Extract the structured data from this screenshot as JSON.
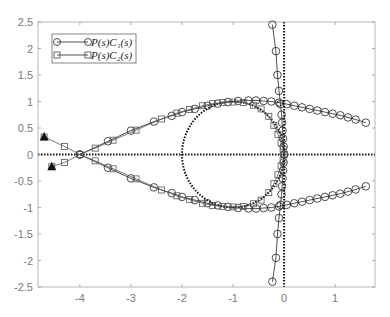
{
  "chart_data": {
    "type": "line",
    "title": "",
    "xlabel": "",
    "ylabel": "",
    "xlim": [
      -4.82,
      1.78
    ],
    "ylim": [
      -2.5,
      2.5
    ],
    "grid": false,
    "legend_position": "top-left",
    "x_ticks": [
      {
        "value": -4,
        "label": "-4"
      },
      {
        "value": -3,
        "label": "-3"
      },
      {
        "value": -2,
        "label": "-2"
      },
      {
        "value": -1,
        "label": "-1"
      },
      {
        "value": 0,
        "label": "0"
      },
      {
        "value": 1,
        "label": "1"
      }
    ],
    "y_ticks": [
      {
        "value": 2.5,
        "label": "2.5"
      },
      {
        "value": 2,
        "label": "2"
      },
      {
        "value": 1.5,
        "label": "1.5"
      },
      {
        "value": 1,
        "label": "1"
      },
      {
        "value": 0.5,
        "label": "0.5"
      },
      {
        "value": 0,
        "label": "0"
      },
      {
        "value": -0.5,
        "label": "-0.5"
      },
      {
        "value": -1,
        "label": "-1"
      },
      {
        "value": -1.5,
        "label": "-1.5"
      },
      {
        "value": -2,
        "label": "-2"
      },
      {
        "value": -2.5,
        "label": "-2.5"
      }
    ],
    "legend": [
      {
        "label": "P(s)C₁(s)",
        "marker": "circle"
      },
      {
        "label": "P(s)C₂(s)",
        "marker": "square"
      }
    ],
    "reference": {
      "unit_circle": {
        "center": [
          -1,
          0
        ],
        "radius": 1,
        "style": "dotted"
      },
      "horizontal_axis_line": {
        "y": 0,
        "style": "dotted"
      },
      "vertical_axis_line": {
        "x": 0,
        "style": "dotted"
      }
    },
    "annotations": [
      {
        "type": "triangle-marker",
        "x": -4.7,
        "y": 0.33
      },
      {
        "type": "triangle-marker",
        "x": -4.55,
        "y": -0.23
      }
    ],
    "series": [
      {
        "name": "P(s)C1(s) upper branch",
        "marker": "circle",
        "points": [
          [
            -4.0,
            0.0
          ],
          [
            -3.45,
            0.25
          ],
          [
            -3.0,
            0.45
          ],
          [
            -2.55,
            0.62
          ],
          [
            -2.2,
            0.73
          ],
          [
            -2.0,
            0.8
          ],
          [
            -1.75,
            0.86
          ],
          [
            -1.5,
            0.92
          ],
          [
            -1.3,
            0.96
          ],
          [
            -1.1,
            0.99
          ],
          [
            -0.9,
            1.01
          ],
          [
            -0.7,
            1.02
          ],
          [
            -0.55,
            1.02
          ],
          [
            -0.4,
            1.01
          ],
          [
            -0.25,
            1.0
          ],
          [
            -0.1,
            0.98
          ],
          [
            0.05,
            0.95
          ],
          [
            0.2,
            0.92
          ],
          [
            0.35,
            0.89
          ],
          [
            0.5,
            0.86
          ],
          [
            0.65,
            0.83
          ],
          [
            0.8,
            0.8
          ],
          [
            0.95,
            0.77
          ],
          [
            1.1,
            0.74
          ],
          [
            1.25,
            0.7
          ],
          [
            1.4,
            0.66
          ],
          [
            1.6,
            0.6
          ]
        ]
      },
      {
        "name": "P(s)C1(s) lower branch",
        "marker": "circle",
        "points": [
          [
            -4.0,
            0.0
          ],
          [
            -3.45,
            -0.25
          ],
          [
            -3.0,
            -0.45
          ],
          [
            -2.55,
            -0.62
          ],
          [
            -2.2,
            -0.73
          ],
          [
            -2.0,
            -0.8
          ],
          [
            -1.75,
            -0.86
          ],
          [
            -1.5,
            -0.92
          ],
          [
            -1.3,
            -0.96
          ],
          [
            -1.1,
            -0.99
          ],
          [
            -0.9,
            -1.01
          ],
          [
            -0.7,
            -1.02
          ],
          [
            -0.55,
            -1.02
          ],
          [
            -0.4,
            -1.01
          ],
          [
            -0.25,
            -1.0
          ],
          [
            -0.1,
            -0.98
          ],
          [
            0.05,
            -0.95
          ],
          [
            0.2,
            -0.92
          ],
          [
            0.35,
            -0.89
          ],
          [
            0.5,
            -0.86
          ],
          [
            0.65,
            -0.83
          ],
          [
            0.8,
            -0.8
          ],
          [
            0.95,
            -0.77
          ],
          [
            1.1,
            -0.74
          ],
          [
            1.25,
            -0.7
          ],
          [
            1.4,
            -0.66
          ],
          [
            1.6,
            -0.6
          ]
        ]
      },
      {
        "name": "P(s)C1(s) high-frequency branch",
        "marker": "circle",
        "points": [
          [
            -0.23,
            2.45
          ],
          [
            -0.16,
            1.95
          ],
          [
            -0.13,
            1.5
          ],
          [
            -0.1,
            1.2
          ],
          [
            -0.07,
            0.95
          ],
          [
            -0.05,
            0.75
          ],
          [
            -0.04,
            0.6
          ],
          [
            -0.03,
            0.45
          ],
          [
            -0.02,
            0.3
          ],
          [
            -0.01,
            0.15
          ],
          [
            0.0,
            0.0
          ],
          [
            -0.01,
            -0.15
          ],
          [
            -0.02,
            -0.3
          ],
          [
            -0.03,
            -0.45
          ],
          [
            -0.04,
            -0.6
          ],
          [
            -0.05,
            -0.75
          ],
          [
            -0.07,
            -0.95
          ],
          [
            -0.1,
            -1.2
          ],
          [
            -0.13,
            -1.5
          ],
          [
            -0.16,
            -1.95
          ],
          [
            -0.23,
            -2.4
          ]
        ]
      },
      {
        "name": "P(s)C2(s) upper branch",
        "marker": "square",
        "points": [
          [
            -4.7,
            0.33
          ],
          [
            -4.3,
            0.15
          ],
          [
            -4.0,
            0.0
          ],
          [
            -3.7,
            0.12
          ],
          [
            -3.35,
            0.27
          ],
          [
            -2.9,
            0.46
          ],
          [
            -2.4,
            0.67
          ],
          [
            -2.1,
            0.78
          ],
          [
            -1.85,
            0.85
          ],
          [
            -1.6,
            0.92
          ],
          [
            -1.4,
            0.96
          ],
          [
            -1.2,
            0.98
          ],
          [
            -1.0,
            0.99
          ],
          [
            -0.8,
            0.98
          ],
          [
            -0.6,
            0.93
          ],
          [
            -0.45,
            0.86
          ],
          [
            -0.3,
            0.72
          ],
          [
            -0.2,
            0.55
          ],
          [
            -0.12,
            0.38
          ],
          [
            -0.06,
            0.22
          ],
          [
            -0.02,
            0.1
          ],
          [
            0.0,
            0.0
          ]
        ]
      },
      {
        "name": "P(s)C2(s) lower branch",
        "marker": "square",
        "points": [
          [
            -4.55,
            -0.23
          ],
          [
            -4.3,
            -0.15
          ],
          [
            -4.0,
            0.0
          ],
          [
            -3.7,
            -0.12
          ],
          [
            -3.35,
            -0.27
          ],
          [
            -2.9,
            -0.46
          ],
          [
            -2.4,
            -0.67
          ],
          [
            -2.1,
            -0.78
          ],
          [
            -1.85,
            -0.85
          ],
          [
            -1.6,
            -0.92
          ],
          [
            -1.4,
            -0.96
          ],
          [
            -1.2,
            -0.98
          ],
          [
            -1.0,
            -0.99
          ],
          [
            -0.8,
            -0.98
          ],
          [
            -0.6,
            -0.93
          ],
          [
            -0.45,
            -0.86
          ],
          [
            -0.3,
            -0.72
          ],
          [
            -0.2,
            -0.55
          ],
          [
            -0.12,
            -0.38
          ],
          [
            -0.06,
            -0.22
          ],
          [
            -0.02,
            -0.1
          ],
          [
            0.0,
            0.0
          ]
        ]
      }
    ]
  }
}
